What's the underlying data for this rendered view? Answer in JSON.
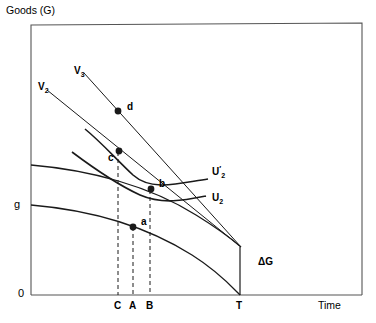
{
  "figure": {
    "type": "economics-intertemporal-diagram",
    "background": "#ffffff",
    "line_color": "#1a1a1a",
    "frame": {
      "x": 31,
      "y": 25,
      "width": 331,
      "height": 270
    }
  },
  "axes": {
    "y_axis_title": "Goods (G)",
    "x_axis_title": "Time",
    "origin_label": "0",
    "y_level_label": "g",
    "x_ticks": [
      {
        "label": "C",
        "x": 118
      },
      {
        "label": "A",
        "x": 133
      },
      {
        "label": "B",
        "x": 150
      },
      {
        "label": "T",
        "x": 240
      }
    ]
  },
  "points": [
    {
      "label": "a",
      "x": 133,
      "y": 227,
      "label_dx": 8,
      "label_dy": -5
    },
    {
      "label": "b",
      "x": 151,
      "y": 189,
      "label_dx": 8,
      "label_dy": -5
    },
    {
      "label": "c",
      "x": 119,
      "y": 151,
      "label_dx": -11,
      "label_dy": 7
    },
    {
      "label": "d",
      "x": 118,
      "y": 111,
      "label_dx": 9,
      "label_dy": -4
    }
  ],
  "curve_labels": [
    {
      "name": "V2",
      "base": "V",
      "sub": "2",
      "prime": "",
      "x": 38,
      "y": 82
    },
    {
      "name": "V3",
      "base": "V",
      "sub": "3",
      "prime": "",
      "x": 74,
      "y": 66
    },
    {
      "name": "U2prime",
      "base": "U",
      "sub": "2",
      "prime": "′",
      "x": 212,
      "y": 165
    },
    {
      "name": "U2",
      "base": "U",
      "sub": "2",
      "prime": "",
      "x": 212,
      "y": 193
    }
  ],
  "annotations": [
    {
      "name": "delta-g",
      "text": "ΔG",
      "x": 258,
      "y": 257
    }
  ],
  "geometry": {
    "budget_line_v2": {
      "x1": 47,
      "y1": 90,
      "x2": 241,
      "y2": 247
    },
    "budget_line_v3": {
      "x1": 84,
      "y1": 73,
      "x2": 241,
      "y2": 247
    },
    "indiff_u2prime": "M 85 129 C 101 142, 115 158, 133 175 C 152 192, 180 183, 208 179",
    "indiff_u2": "M 72 152 C 92 167, 116 184, 140 195 C 163 205, 186 200, 206 196",
    "ppf_upper": "M 31 165 C 90 170, 150 186, 196 215 C 222 231, 234 241, 241 247",
    "ppf_lower": "M 31 205 C 90 210, 146 226, 192 255 C 219 272, 233 288, 240 295",
    "t_vertical": {
      "x": 240,
      "y1": 247,
      "y2": 295
    },
    "dashed_lines": [
      {
        "x": 118,
        "y1": 152,
        "y2": 295
      },
      {
        "x": 133,
        "y1": 227,
        "y2": 295
      },
      {
        "x": 150,
        "y1": 190,
        "y2": 295
      }
    ]
  }
}
